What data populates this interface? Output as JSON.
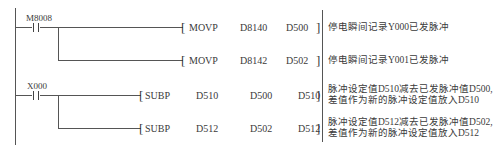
{
  "diagram": {
    "type": "ladder",
    "rungs": [
      {
        "contact": {
          "label": "M8008",
          "kind": "normally-open"
        },
        "instructions": [
          {
            "op": "MOVP",
            "operands": [
              "D8140",
              "D500"
            ],
            "comment": "停电瞬间记录Y000已发脉冲"
          },
          {
            "op": "MOVP",
            "operands": [
              "D8142",
              "D502"
            ],
            "comment": "停电瞬间记录Y001已发脉冲"
          }
        ]
      },
      {
        "contact": {
          "label": "X000",
          "kind": "normally-open"
        },
        "instructions": [
          {
            "op": "SUBP",
            "operands": [
              "D510",
              "D500",
              "D510"
            ],
            "comment_lines": [
              "脉冲设定值D510减去已发脉冲值D500,",
              "差值作为新的脉冲设定值放入D510"
            ]
          },
          {
            "op": "SUBP",
            "operands": [
              "D512",
              "D502",
              "D512"
            ],
            "comment_lines": [
              "脉冲设定值D512减去已发脉冲值D502,",
              "差值作为新的脉冲设定值放入D512"
            ]
          }
        ]
      }
    ],
    "brackets": {
      "open": "[",
      "close": "]"
    }
  }
}
